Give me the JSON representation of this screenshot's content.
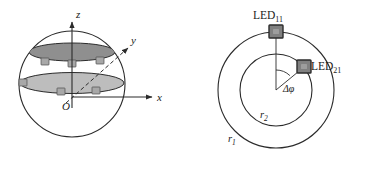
{
  "figure": {
    "background_color": "#ffffff",
    "stroke_color": "#2b2b2b",
    "led_fill_color": "#8c8c8c",
    "led_stroke_color": "#3a3a3a",
    "upper_disc_color": "#8f8f8f",
    "lower_disc_color": "#bdbdbd"
  },
  "sphere_panel": {
    "name": "3D sphere LED arrangement",
    "axes": [
      {
        "id": "z",
        "label": "z",
        "direction": "up",
        "style": "solid-arrow"
      },
      {
        "id": "x",
        "label": "x",
        "direction": "right",
        "style": "solid-arrow"
      },
      {
        "id": "y",
        "label": "y",
        "direction": "up-right-diagonal",
        "style": "dashed-arrow"
      }
    ],
    "origin_label": "O",
    "discs": [
      {
        "id": "upper",
        "shade": "dark",
        "led_count": 3
      },
      {
        "id": "lower",
        "shade": "light",
        "led_count": 3
      }
    ]
  },
  "topview_panel": {
    "name": "Top view of concentric LED rings",
    "circles": [
      {
        "id": "outer",
        "radius_label": "r",
        "radius_sub": "1"
      },
      {
        "id": "inner",
        "radius_label": "r",
        "radius_sub": "2"
      }
    ],
    "leds": [
      {
        "id": "led11",
        "label": "LED",
        "subscript": "11",
        "ring": "outer",
        "position": "top"
      },
      {
        "id": "led21",
        "label": "LED",
        "subscript": "21",
        "ring": "inner",
        "position": "upper-right"
      }
    ],
    "angle": {
      "symbol": "Δφ",
      "name": "angular offset between LED11 and LED21"
    }
  }
}
